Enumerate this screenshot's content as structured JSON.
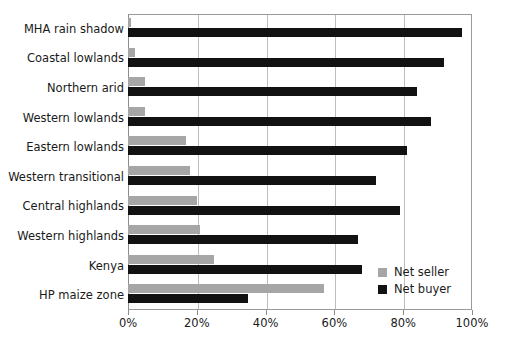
{
  "chart_data": {
    "type": "bar",
    "orientation": "horizontal",
    "title": "",
    "xlabel": "",
    "ylabel": "",
    "xlim": [
      0,
      100
    ],
    "xticks": [
      "0%",
      "20%",
      "40%",
      "60%",
      "80%",
      "100%"
    ],
    "xtick_values": [
      0,
      20,
      40,
      60,
      80,
      100
    ],
    "grid": "vertical",
    "legend_position": "bottom-right",
    "categories": [
      "MHA rain shadow",
      "Coastal lowlands",
      "Northern arid",
      "Western lowlands",
      "Eastern lowlands",
      "Western transitional",
      "Central highlands",
      "Western highlands",
      "Kenya",
      "HP maize zone"
    ],
    "series": [
      {
        "name": "Net seller",
        "color": "#a6a6a6",
        "values": [
          1,
          2,
          5,
          5,
          17,
          18,
          20,
          21,
          25,
          57
        ]
      },
      {
        "name": "Net buyer",
        "color": "#121212",
        "values": [
          97,
          92,
          84,
          88,
          81,
          72,
          79,
          67,
          68,
          35
        ]
      }
    ]
  },
  "legend": {
    "items": [
      {
        "label": "Net seller",
        "color": "#a6a6a6"
      },
      {
        "label": "Net buyer",
        "color": "#121212"
      }
    ]
  }
}
